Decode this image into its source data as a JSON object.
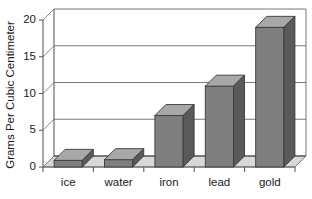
{
  "chart_data": {
    "type": "bar",
    "title": "",
    "xlabel": "",
    "ylabel": "Grams Per Cubic Centimeter",
    "categories": [
      "ice",
      "water",
      "iron",
      "lead",
      "gold"
    ],
    "values": [
      0.9,
      1.0,
      7.0,
      11.0,
      19.0
    ],
    "ylim": [
      0,
      20
    ],
    "yticks": [
      0,
      5,
      10,
      15,
      20
    ],
    "ytick_labels": [
      "0",
      "5",
      "10",
      "15",
      "20"
    ],
    "grid": true,
    "legend": null,
    "style": "3d-bar",
    "colors": {
      "bar_front": "#7f7f7f",
      "bar_top": "#a8a8a8",
      "bar_side": "#5a5a5a",
      "floor": "#d8d8d8",
      "axis": "#5d5d5d",
      "grid": "#6a6a6a",
      "text": "#1a1a1a",
      "background": "#ffffff"
    }
  }
}
